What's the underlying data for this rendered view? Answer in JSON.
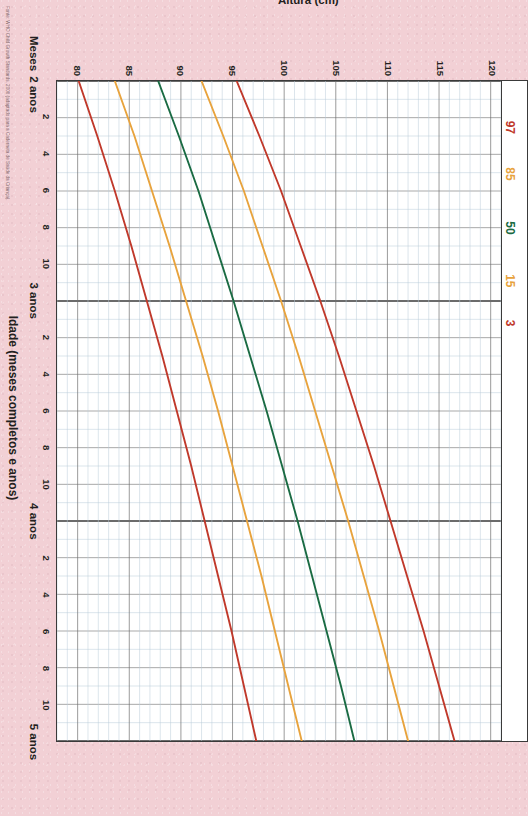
{
  "page": {
    "background_color": "#f2d0d5",
    "plot_background": "#ffffff",
    "caption": "Fonte: WHO Child Growth Standards, 2006 (adaptado para a Caderneta de Saúde da Criança)."
  },
  "axes": {
    "y_title": "Altura (cm)",
    "x_title": "Idade (meses completos e anos)",
    "months_label": "Meses",
    "y_ticks": [
      120,
      115,
      110,
      105,
      100,
      95,
      90,
      85,
      80
    ],
    "y_min": 78,
    "y_max": 121,
    "x_min_months": 24,
    "x_max_months": 60,
    "x_year_labels": [
      "2 anos",
      "3 anos",
      "4 anos",
      "5 anos"
    ],
    "x_year_months": [
      24,
      36,
      48,
      60
    ],
    "x_month_ticks": [
      26,
      28,
      30,
      32,
      34,
      38,
      40,
      42,
      44,
      46,
      50,
      52,
      54,
      56,
      58
    ],
    "x_month_tick_labels": [
      "2",
      "4",
      "6",
      "8",
      "10",
      "2",
      "4",
      "6",
      "8",
      "10",
      "2",
      "4",
      "6",
      "8",
      "10"
    ],
    "grid_major_color": "#6f6f6f",
    "grid_minor_color": "#b9cbd8"
  },
  "legend": {
    "entries": [
      {
        "label": "97",
        "color": "#c0392b"
      },
      {
        "label": "85",
        "color": "#e8a33d"
      },
      {
        "label": "50",
        "color": "#1a6b43"
      },
      {
        "label": "15",
        "color": "#e8a33d"
      },
      {
        "label": "3",
        "color": "#c0392b"
      }
    ]
  },
  "chart_data": {
    "type": "line",
    "title": "",
    "subtitle": "",
    "xlabel": "Idade (meses completos e anos)",
    "ylabel": "Altura (cm)",
    "xlim": [
      24,
      60
    ],
    "ylim": [
      78,
      121
    ],
    "grid": true,
    "legend_position": "top-inside",
    "x_unit": "months",
    "x": [
      24,
      27,
      30,
      33,
      36,
      39,
      42,
      45,
      48,
      51,
      54,
      57,
      60
    ],
    "series": [
      {
        "name": "97",
        "color": "#c0392b",
        "values": [
          95.4,
          97.6,
          99.7,
          101.6,
          103.5,
          105.3,
          107.0,
          108.7,
          110.3,
          111.9,
          113.5,
          115.0,
          116.5
        ]
      },
      {
        "name": "85",
        "color": "#e8a33d",
        "values": [
          92.0,
          94.1,
          96.1,
          97.9,
          99.7,
          101.4,
          103.0,
          104.6,
          106.2,
          107.7,
          109.2,
          110.6,
          112.0
        ]
      },
      {
        "name": "50",
        "color": "#1a6b43",
        "values": [
          87.8,
          89.8,
          91.7,
          93.4,
          95.1,
          96.7,
          98.3,
          99.8,
          101.3,
          102.7,
          104.1,
          105.5,
          106.8
        ]
      },
      {
        "name": "15",
        "color": "#e8a33d",
        "values": [
          83.6,
          85.5,
          87.2,
          88.9,
          90.5,
          92.1,
          93.6,
          95.0,
          96.4,
          97.8,
          99.1,
          100.4,
          101.7
        ]
      },
      {
        "name": "3",
        "color": "#c0392b",
        "values": [
          80.1,
          81.9,
          83.6,
          85.2,
          86.7,
          88.2,
          89.6,
          91.0,
          92.3,
          93.6,
          94.9,
          96.1,
          97.3
        ]
      }
    ]
  }
}
